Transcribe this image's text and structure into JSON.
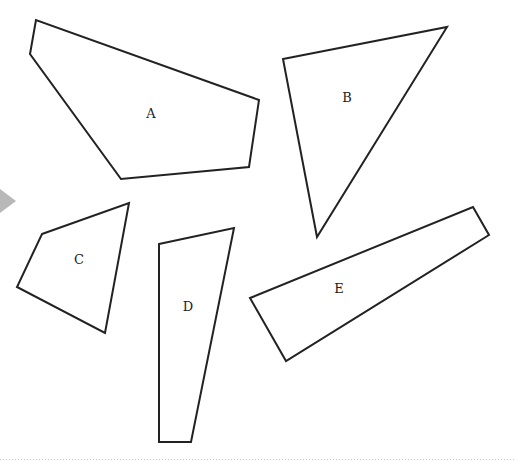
{
  "diagram": {
    "stroke_color": "#222222",
    "fill_color": "#ffffff",
    "marker_color": "#b8b8b8",
    "shapes": [
      {
        "label": "A",
        "points": "36,20 30,54 121,179 249,167 259,100",
        "label_x": 151,
        "label_y": 114
      },
      {
        "label": "B",
        "points": "283,59 447,27 317,237",
        "label_x": 347,
        "label_y": 98
      },
      {
        "label": "C",
        "points": "42,234 129,203 105,333 17,287",
        "label_x": 79,
        "label_y": 260
      },
      {
        "label": "D",
        "points": "159,244 234,228 191,442 159,442",
        "label_x": 188,
        "label_y": 307
      },
      {
        "label": "E",
        "points": "250,298 473,207 489,235 286,361",
        "label_x": 339,
        "label_y": 289
      }
    ]
  }
}
